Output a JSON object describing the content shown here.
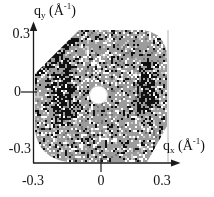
{
  "figure": {
    "y_axis": {
      "symbol": "q",
      "subscript": "y",
      "unit_open": " (Å",
      "unit_exponent": "-1",
      "unit_close": ")",
      "tick_labels": [
        "0.3",
        "0",
        "-0.3"
      ]
    },
    "x_axis": {
      "symbol": "q",
      "subscript": "x",
      "unit_open": " (Å",
      "unit_exponent": "-1",
      "unit_close": ")",
      "tick_labels": [
        "-0.3",
        "0",
        "0.3"
      ]
    }
  },
  "chart_data": {
    "type": "heatmap",
    "title": "",
    "xlabel": "qx (Å-1)",
    "ylabel": "qy (Å-1)",
    "xlim": [
      -0.3,
      0.3
    ],
    "ylim": [
      -0.3,
      0.3
    ],
    "x_ticks": [
      -0.3,
      0,
      0.3
    ],
    "y_ticks": [
      0.3,
      0,
      -0.3
    ],
    "grid": false,
    "legend": "none",
    "detector": {
      "shape": "octagon",
      "beamstop": {
        "qx": 0,
        "qy": 0,
        "radius_q": 0.041
      },
      "lobes": [
        {
          "qx": -0.177,
          "qy": 0.0,
          "half_width_q": 0.085,
          "half_height_q": 0.22
        },
        {
          "qx": 0.213,
          "qy": 0.02,
          "half_width_q": 0.072,
          "half_height_q": 0.2
        }
      ],
      "edge_arc": "dark speckle arc along upper-left detector edge"
    },
    "palette": {
      "background": "#9c9c9c",
      "speckle_black": "#101010",
      "speckle_white": "#ffffff",
      "speckle_light": "#c9c9c9",
      "speckle_dark_gray": "#757575",
      "beamstop": "#ffffff",
      "axis": "#1a1a1a",
      "frame_line": "#b4b4b4",
      "page": "#ffffff"
    }
  }
}
